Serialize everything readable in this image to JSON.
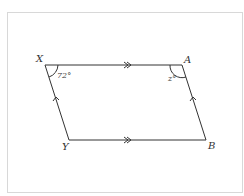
{
  "diagram": {
    "type": "parallelogram",
    "vertices": [
      {
        "name": "X",
        "label": "X"
      },
      {
        "name": "A",
        "label": "A"
      },
      {
        "name": "B",
        "label": "B"
      },
      {
        "name": "Y",
        "label": "Y"
      }
    ],
    "angles": {
      "X": "72°",
      "A": "z°"
    },
    "parallel_marks": {
      "XA_YB": "double-arrow",
      "XY_AB": "single-arrow"
    },
    "colors": {
      "line": "#333333",
      "frame": "#d8d8d8"
    }
  }
}
